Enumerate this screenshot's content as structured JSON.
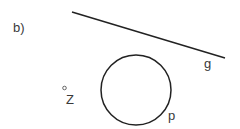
{
  "figure": {
    "part_label": "b)",
    "line": {
      "label": "g",
      "x1": 72,
      "y1": 12,
      "x2": 225,
      "y2": 58
    },
    "circle": {
      "label": "p",
      "cx": 136,
      "cy": 90,
      "r": 35
    },
    "point": {
      "label": "Z",
      "cx": 64.5,
      "cy": 88
    }
  }
}
